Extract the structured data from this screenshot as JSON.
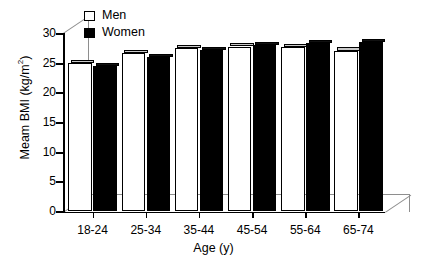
{
  "chart_data": {
    "type": "bar",
    "title": "",
    "subtitle": "",
    "xlabel": "Age (y)",
    "ylabel": "Meam BMI (kg/m2)",
    "ylabel_parts": {
      "prefix": "Meam BMI (kg/m",
      "sup": "2",
      "suffix": ")"
    },
    "categories": [
      "18-24",
      "25-34",
      "35-44",
      "45-54",
      "55-64",
      "65-74"
    ],
    "series": [
      {
        "name": "Men",
        "color": "#ffffff",
        "values": [
          24.9,
          26.6,
          27.4,
          27.7,
          27.6,
          27.0
        ]
      },
      {
        "name": "Women",
        "color": "#000000",
        "values": [
          24.4,
          25.9,
          27.1,
          27.9,
          28.3,
          28.5
        ]
      }
    ],
    "ylim": [
      0,
      30
    ],
    "yticks": [
      0,
      5,
      10,
      15,
      20,
      25,
      30
    ],
    "ytick_labels": [
      "0",
      "5",
      "10",
      "15",
      "20",
      "25",
      "30"
    ],
    "grid": false,
    "legend_position": "top-left",
    "style": "3d-bar"
  },
  "legend": {
    "items": [
      {
        "label": "Men",
        "swatch": "hollow-square"
      },
      {
        "label": "Women",
        "swatch": "filled-square"
      }
    ]
  }
}
